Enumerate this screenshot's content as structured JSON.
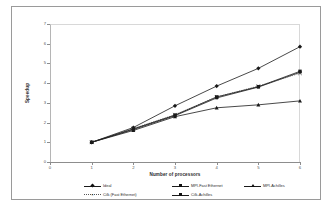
{
  "chart_data": {
    "type": "line",
    "title": "",
    "xlabel": "Number of processors",
    "ylabel": "Speedup",
    "x": [
      1,
      2,
      3,
      4,
      5,
      6
    ],
    "xlim": [
      0,
      6
    ],
    "ylim": [
      0,
      7
    ],
    "xticks": [
      "0",
      "1",
      "2",
      "3",
      "4",
      "5",
      "6"
    ],
    "yticks": [
      "0",
      "1",
      "2",
      "3",
      "4",
      "5",
      "6",
      "7"
    ],
    "grid": false,
    "legend_position": "bottom",
    "series": [
      {
        "name": "Ideal",
        "marker": "diamond",
        "line_style": "solid",
        "color": "#1a1a1a",
        "values": [
          1.0,
          1.75,
          2.85,
          3.85,
          4.75,
          5.85
        ]
      },
      {
        "name": "MPI-Fast Ethernet",
        "marker": "square",
        "line_style": "solid",
        "color": "#1a1a1a",
        "values": [
          1.0,
          1.65,
          2.35,
          3.25,
          3.8,
          4.55
        ]
      },
      {
        "name": "MPI-Achilles",
        "marker": "triangle",
        "line_style": "solid",
        "color": "#1a1a1a",
        "values": [
          1.0,
          1.6,
          2.3,
          2.75,
          2.9,
          3.1
        ]
      },
      {
        "name": "Cilk (Fast Ethernet)",
        "marker": "x",
        "line_style": "dotted",
        "color": "#555555",
        "values": [
          1.0,
          1.7,
          2.4,
          3.3,
          3.85,
          4.5
        ]
      },
      {
        "name": "Cilk-Achilles",
        "marker": "square-filled",
        "line_style": "solid",
        "color": "#1a1a1a",
        "values": [
          1.0,
          1.68,
          2.38,
          3.3,
          3.82,
          4.6
        ]
      }
    ]
  }
}
